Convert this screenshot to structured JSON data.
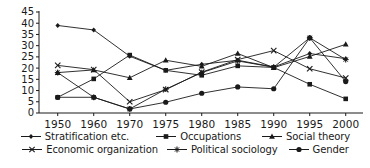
{
  "chart_data": {
    "type": "line",
    "title": "",
    "subtitle": "",
    "xlabel": "",
    "ylabel": "",
    "categories": [
      "1950",
      "1960",
      "1970",
      "1975",
      "1980",
      "1985",
      "1990",
      "1995",
      "2000"
    ],
    "x": [
      1950,
      1960,
      1970,
      1975,
      1980,
      1985,
      1990,
      1995,
      2000
    ],
    "ylim": [
      0,
      45
    ],
    "yticks": [
      0,
      5,
      10,
      15,
      20,
      25,
      30,
      35,
      40,
      45
    ],
    "grid": false,
    "legend_position": "bottom",
    "colors": {
      "line": "#1a1a1a",
      "axis": "#1a1a1a",
      "background": "#ffffff"
    },
    "series": [
      {
        "name": "Stratification etc.",
        "marker": "diamond",
        "values": [
          39.0,
          37.0,
          25.3,
          19.0,
          21.7,
          23.5,
          20.5,
          26.5,
          24.2
        ]
      },
      {
        "name": "Occupations",
        "marker": "square",
        "values": [
          7.0,
          15.2,
          25.8,
          19.0,
          16.8,
          21.0,
          20.3,
          12.8,
          6.3
        ]
      },
      {
        "name": "Social theory",
        "marker": "triangle",
        "values": [
          18.0,
          19.2,
          15.7,
          23.5,
          20.8,
          26.5,
          20.2,
          25.2,
          30.6
        ]
      },
      {
        "name": "Economic organization",
        "marker": "cross",
        "values": [
          21.2,
          19.3,
          5.0,
          10.4,
          18.2,
          23.8,
          27.8,
          19.7,
          15.6
        ]
      },
      {
        "name": "Political sociology",
        "marker": "star",
        "values": [
          18.0,
          7.0,
          1.8,
          10.6,
          18.0,
          23.2,
          20.4,
          33.5,
          23.8
        ]
      },
      {
        "name": "Gender",
        "marker": "circle",
        "values": [
          7.0,
          7.0,
          1.8,
          4.8,
          8.8,
          11.6,
          10.8,
          33.5,
          14.0
        ]
      }
    ]
  },
  "axes": {
    "y_tick_labels": [
      "45",
      "40",
      "35",
      "30",
      "25",
      "20",
      "15",
      "10",
      "5",
      "0"
    ],
    "x_tick_labels": [
      "1950",
      "1960",
      "1970",
      "1975",
      "1980",
      "1985",
      "1990",
      "1995",
      "2000"
    ]
  },
  "legend": {
    "rows": [
      [
        {
          "label": "Stratification etc.",
          "marker": "diamond"
        },
        {
          "label": "Occupations",
          "marker": "square"
        },
        {
          "label": "Social theory",
          "marker": "triangle"
        }
      ],
      [
        {
          "label": "Economic organization",
          "marker": "cross"
        },
        {
          "label": "Political sociology",
          "marker": "star"
        },
        {
          "label": "Gender",
          "marker": "circle"
        }
      ]
    ]
  }
}
